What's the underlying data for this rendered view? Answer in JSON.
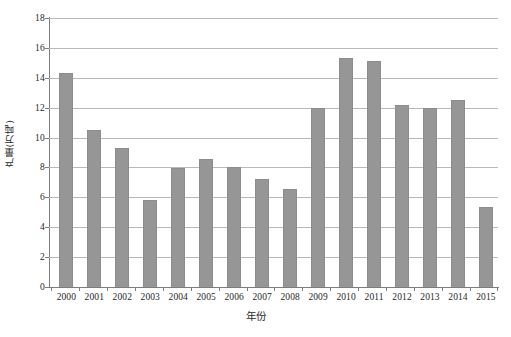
{
  "chart_data": {
    "type": "bar",
    "title": "",
    "subtitle": "",
    "xlabel": "年份",
    "ylabel": "产量(万吨)",
    "categories": [
      "2000",
      "2001",
      "2002",
      "2003",
      "2004",
      "2005",
      "2006",
      "2007",
      "2008",
      "2009",
      "2010",
      "2011",
      "2012",
      "2013",
      "2014",
      "2015"
    ],
    "values": [
      14.35,
      10.5,
      9.3,
      5.85,
      7.95,
      8.55,
      8.05,
      7.2,
      6.55,
      12.0,
      15.35,
      15.1,
      12.2,
      11.95,
      12.5,
      5.35
    ],
    "series": [
      {
        "name": "产量",
        "values": [
          14.35,
          10.5,
          9.3,
          5.85,
          7.95,
          8.55,
          8.05,
          7.2,
          6.55,
          12.0,
          15.35,
          15.1,
          12.2,
          11.95,
          12.5,
          5.35
        ]
      }
    ],
    "ylim": [
      0,
      18
    ],
    "ytick_step": 2,
    "yticks": [
      0,
      2,
      4,
      6,
      8,
      10,
      12,
      14,
      16,
      18
    ],
    "ytick_labels": [
      "0",
      "2",
      "4",
      "6",
      "8",
      "10",
      "12",
      "14",
      "16",
      "18"
    ],
    "xlim_categories": 16,
    "grid": {
      "horizontal": true,
      "vertical": false,
      "color": "#b9b9b9"
    },
    "legend": {
      "visible": false,
      "position": "none",
      "entries": []
    },
    "annotations": [],
    "colors": {
      "bar_fill": "#969696",
      "bar_edge": "#8c8c8c",
      "gridline": "#b9b9b9",
      "axis_line": "#7d7d7d",
      "text": "#1f1f1f",
      "background": "#ffffff"
    }
  }
}
